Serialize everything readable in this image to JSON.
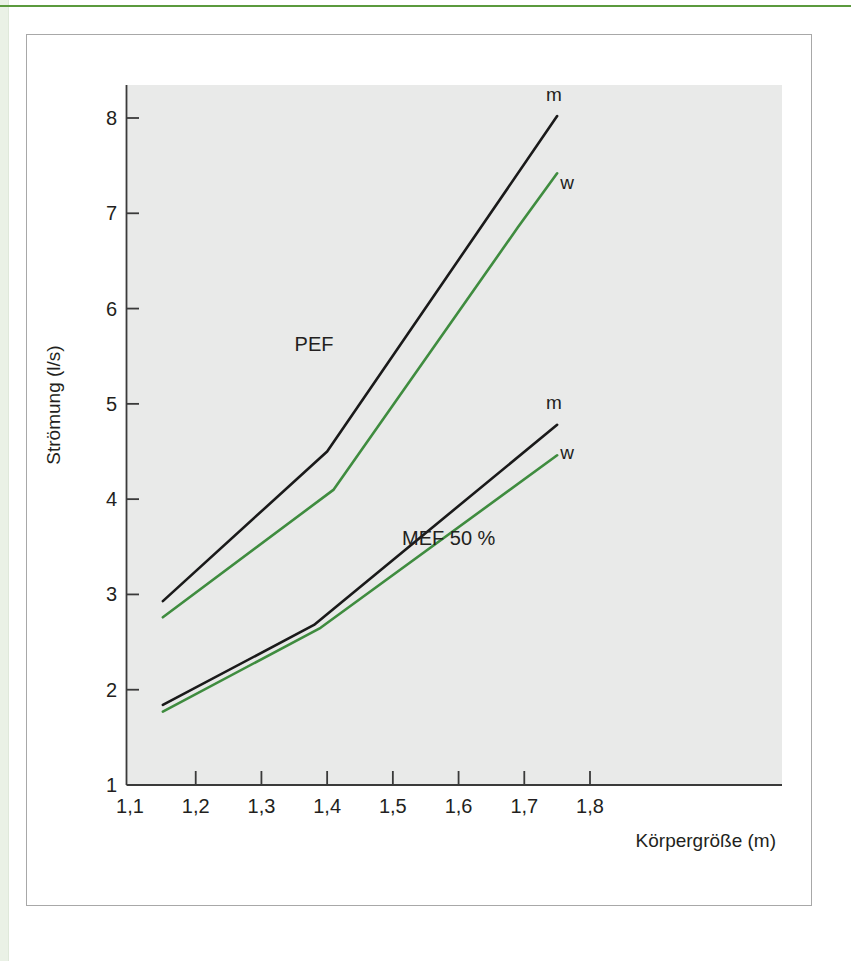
{
  "page": {
    "top_caption": "",
    "stripe_color": "#eaf1e6",
    "rule_color": "#5b9a3e",
    "card_border_color": "#a8a8a8",
    "background": "#ffffff"
  },
  "figure": {
    "plot_background": "#e9eae9",
    "axis_color": "#3a3a3a"
  },
  "chart_data": {
    "type": "line",
    "title": "",
    "xlabel": "Körpergröße (m)",
    "ylabel": "Strömung (l/s)",
    "xlim": [
      1.1,
      1.85
    ],
    "ylim": [
      1,
      8.35
    ],
    "grid": false,
    "legend_position": "inline-end-of-line",
    "xticks": [
      1.1,
      1.2,
      1.3,
      1.4,
      1.5,
      1.6,
      1.7,
      1.8
    ],
    "xtick_labels": [
      "1,1",
      "1,2",
      "1,3",
      "1,4",
      "1,5",
      "1,6",
      "1,7",
      "1,8"
    ],
    "yticks": [
      1,
      2,
      3,
      4,
      5,
      6,
      7,
      8
    ],
    "ytick_labels": [
      "1",
      "2",
      "3",
      "4",
      "5",
      "6",
      "7",
      "8"
    ],
    "annotations": [
      {
        "text": "PEF",
        "x": 1.38,
        "y": 5.55
      },
      {
        "text": "MEF 50 %",
        "x": 1.585,
        "y": 3.52
      }
    ],
    "series": [
      {
        "name": "PEF m",
        "group": "PEF",
        "label": "m",
        "color": "#1a1a1a",
        "label_x": 1.745,
        "label_y": 8.18,
        "x": [
          1.15,
          1.4,
          1.75
        ],
        "y": [
          2.93,
          4.5,
          8.02
        ]
      },
      {
        "name": "PEF w",
        "group": "PEF",
        "label": "w",
        "color": "#3f8c3f",
        "label_x": 1.765,
        "label_y": 7.25,
        "x": [
          1.15,
          1.41,
          1.69,
          1.75
        ],
        "y": [
          2.76,
          4.1,
          6.85,
          7.42
        ]
      },
      {
        "name": "MEF 50 % m",
        "group": "MEF 50 %",
        "label": "m",
        "color": "#1a1a1a",
        "label_x": 1.745,
        "label_y": 4.95,
        "x": [
          1.15,
          1.38,
          1.75
        ],
        "y": [
          1.84,
          2.68,
          4.78
        ]
      },
      {
        "name": "MEF 50 % w",
        "group": "MEF 50 %",
        "label": "w",
        "color": "#3f8c3f",
        "label_x": 1.765,
        "label_y": 4.42,
        "x": [
          1.15,
          1.39,
          1.75
        ],
        "y": [
          1.77,
          2.65,
          4.46
        ]
      }
    ]
  }
}
